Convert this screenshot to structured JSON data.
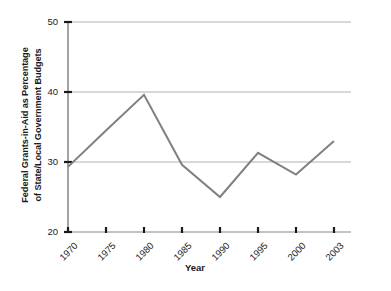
{
  "chart_data": {
    "type": "line",
    "title": "",
    "xlabel": "Year",
    "ylabel": "Federal Grants-in-Aid as Percentage of State/Local Government Budgets",
    "ylabel_line1": "Federal Grants-in-Aid as Percentage",
    "ylabel_line2": "of State/Local Government Budgets",
    "categories": [
      "1970",
      "1975",
      "1980",
      "1985",
      "1990",
      "1995",
      "2000",
      "2003"
    ],
    "values": [
      29.3,
      34.5,
      39.6,
      29.6,
      25.0,
      31.3,
      28.2,
      33.0
    ],
    "xtick_labels": [
      "1970",
      "1975",
      "1980",
      "1985",
      "1990",
      "1995",
      "2000",
      "2003"
    ],
    "ytick_labels": [
      "20",
      "30",
      "40",
      "50"
    ],
    "ytick_values": [
      20,
      30,
      40,
      50
    ],
    "ylim": [
      20,
      50
    ],
    "grid": "horizontal",
    "legend": "none",
    "line_color": "#808080",
    "grid_color": "#b0b0b0",
    "axis_color": "#9a9a9a",
    "tick_color": "#1a1a1a",
    "background": "#ffffff"
  }
}
